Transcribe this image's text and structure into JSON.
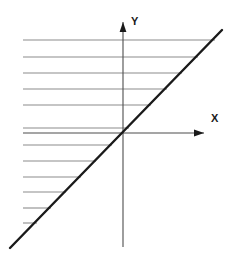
{
  "figure": {
    "background_color": "#ffffff",
    "width": 236,
    "height": 267
  },
  "axes": {
    "x_axis": {
      "label": "X",
      "label_x": 211,
      "label_y": 122,
      "color": "#4d4d4d",
      "stroke_width": 1.1,
      "start_x": 23,
      "end_x": 204,
      "y": 133,
      "arrow": "right"
    },
    "y_axis": {
      "label": "Y",
      "label_x": 131,
      "label_y": 25,
      "color": "#4d4d4d",
      "stroke_width": 1.1,
      "x": 123,
      "start_y": 247,
      "end_y": 22,
      "arrow": "up"
    },
    "origin": {
      "x": 123,
      "y": 133
    }
  },
  "chart_data": {
    "type": "line",
    "title": "",
    "xlabel": "X",
    "ylabel": "Y",
    "grid": false,
    "legend": "none",
    "xlim": [
      -113,
      113
    ],
    "ylim": [
      -114,
      111
    ],
    "series": [
      {
        "name": "boundary-line",
        "type": "line",
        "color": "#1a1a1a",
        "stroke_width": 2.4,
        "slope": 1.03,
        "intercept": 0,
        "x": [
          10,
          222
        ],
        "y": [
          248,
          30
        ],
        "points": [
          {
            "x": 10,
            "y": 248
          },
          {
            "x": 222,
            "y": 30
          }
        ]
      }
    ],
    "hatching": {
      "name": "region-hatching",
      "orientation": "horizontal",
      "color": "#8c8c8c",
      "stroke_width": 1.1,
      "left_x": 23,
      "count": 12,
      "lines": [
        {
          "y": 40,
          "x_start": 23,
          "x_end": 215
        },
        {
          "y": 57,
          "x_start": 23,
          "x_end": 198
        },
        {
          "y": 73,
          "x_start": 23,
          "x_end": 182
        },
        {
          "y": 89,
          "x_start": 23,
          "x_end": 167
        },
        {
          "y": 105,
          "x_start": 23,
          "x_end": 151
        },
        {
          "y": 128,
          "x_start": 23,
          "x_end": 129
        },
        {
          "y": 145,
          "x_start": 23,
          "x_end": 112
        },
        {
          "y": 161,
          "x_start": 23,
          "x_end": 96
        },
        {
          "y": 177,
          "x_start": 23,
          "x_end": 81
        },
        {
          "y": 192,
          "x_start": 23,
          "x_end": 66
        },
        {
          "y": 208,
          "x_start": 23,
          "x_end": 51
        },
        {
          "y": 223,
          "x_start": 23,
          "x_end": 37
        }
      ]
    }
  }
}
